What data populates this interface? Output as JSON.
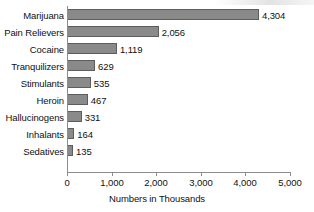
{
  "chart_data": {
    "type": "bar",
    "orientation": "horizontal",
    "title": "",
    "xlabel": "Numbers in Thousands",
    "ylabel": "",
    "xlim": [
      0,
      5000
    ],
    "grid": false,
    "legend": null,
    "categories": [
      "Marijuana",
      "Pain Relievers",
      "Cocaine",
      "Tranquilizers",
      "Stimulants",
      "Heroin",
      "Hallucinogens",
      "Inhalants",
      "Sedatives"
    ],
    "values": [
      4304,
      2056,
      1119,
      629,
      535,
      467,
      331,
      164,
      135
    ],
    "value_labels": [
      "4,304",
      "2,056",
      "1,119",
      "629",
      "535",
      "467",
      "331",
      "164",
      "135"
    ],
    "xticks": [
      0,
      1000,
      2000,
      3000,
      4000,
      5000
    ],
    "xtick_labels": [
      "0",
      "1,000",
      "2,000",
      "3,000",
      "4,000",
      "5,000"
    ],
    "bar_color": "#8a8a8a",
    "bar_edge_color": "#5d5d5d",
    "axis_color": "#8d8d8d",
    "background": "#ffffff"
  }
}
